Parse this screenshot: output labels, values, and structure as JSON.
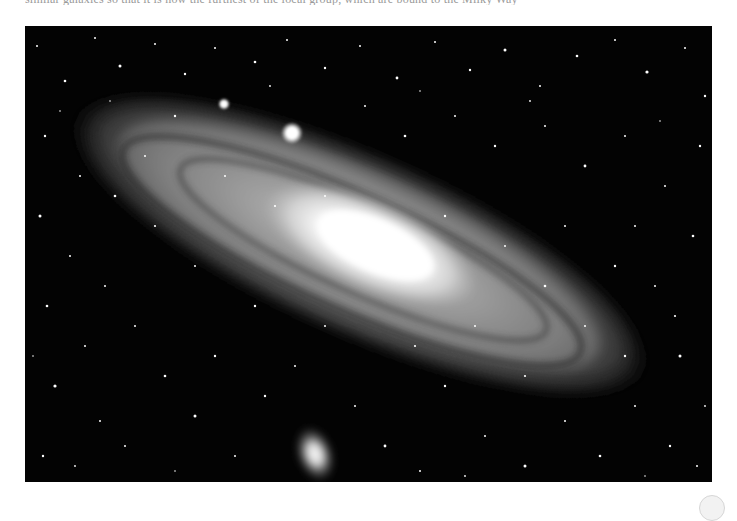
{
  "page": {
    "top_text_clipped": "similar galaxies so that it is now the furthest of the local group, which are bound to the Milky Way",
    "top_text_note": "only the bottom edge of this text line is visible; text not legible"
  },
  "photo": {
    "subject": "Andromeda Galaxy (M31) with companion galaxies",
    "alt": "Black-and-white photograph of a large tilted spiral galaxy with a bright core, dust lanes, a bright foreground star, and a small elliptical companion galaxy below, against a dense star field",
    "colors": {
      "background": "#030303",
      "core": "#ffffff",
      "disk": "#8c8c8c"
    },
    "features": [
      {
        "name": "galaxy-core",
        "x": 360,
        "y": 245
      },
      {
        "name": "bright-foreground-star",
        "x": 292,
        "y": 133
      },
      {
        "name": "small-star",
        "x": 224,
        "y": 104
      },
      {
        "name": "companion-galaxy-m110",
        "x": 315,
        "y": 455
      }
    ]
  },
  "controls": {
    "corner_button_icon": "circle-button"
  }
}
